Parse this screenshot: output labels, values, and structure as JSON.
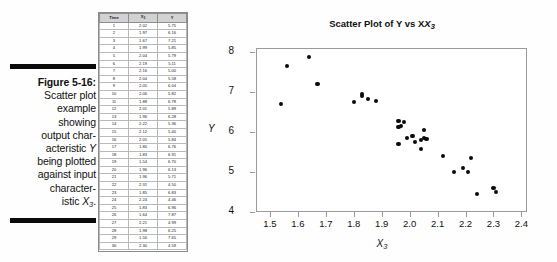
{
  "caption": {
    "figure_label": "Figure 5-16:",
    "lines": [
      "Scatter plot",
      "example",
      "showing",
      "output char-",
      "acteristic Y",
      "being plotted",
      "against input",
      "character-",
      "istic X3."
    ]
  },
  "table": {
    "headers": [
      "Time",
      "X3",
      "Y"
    ],
    "header_base": [
      "Time",
      "X",
      "Y"
    ],
    "header_sub": [
      "",
      "3",
      ""
    ],
    "rows": [
      [
        "1",
        "2.02",
        "5.75"
      ],
      [
        "2",
        "1.97",
        "6.16"
      ],
      [
        "3",
        "1.67",
        "7.21"
      ],
      [
        "4",
        "1.99",
        "5.85"
      ],
      [
        "5",
        "2.04",
        "5.79"
      ],
      [
        "6",
        "2.19",
        "5.11"
      ],
      [
        "7",
        "2.16",
        "5.00"
      ],
      [
        "8",
        "2.04",
        "5.58"
      ],
      [
        "9",
        "2.05",
        "6.04"
      ],
      [
        "10",
        "2.06",
        "5.82"
      ],
      [
        "11",
        "1.88",
        "6.78"
      ],
      [
        "12",
        "2.01",
        "5.89"
      ],
      [
        "13",
        "1.96",
        "6.28"
      ],
      [
        "14",
        "2.22",
        "5.36"
      ],
      [
        "15",
        "2.12",
        "5.40"
      ],
      [
        "16",
        "2.05",
        "5.84"
      ],
      [
        "17",
        "1.80",
        "6.76"
      ],
      [
        "18",
        "1.83",
        "6.91"
      ],
      [
        "19",
        "1.54",
        "6.70"
      ],
      [
        "20",
        "1.96",
        "6.13"
      ],
      [
        "21",
        "1.96",
        "5.71"
      ],
      [
        "22",
        "2.31",
        "4.50"
      ],
      [
        "23",
        "1.85",
        "6.83"
      ],
      [
        "24",
        "2.24",
        "4.46"
      ],
      [
        "25",
        "1.83",
        "6.96"
      ],
      [
        "26",
        "1.64",
        "7.87"
      ],
      [
        "27",
        "2.21",
        "4.99"
      ],
      [
        "28",
        "1.98",
        "6.25"
      ],
      [
        "29",
        "1.56",
        "7.65"
      ],
      [
        "30",
        "2.30",
        "4.59"
      ]
    ]
  },
  "chart_data": {
    "type": "scatter",
    "title_base": "Scatter Plot of Y vs X",
    "title_sub": "3",
    "xlabel": "X3",
    "xlabel_base": "X",
    "xlabel_sub": "3",
    "ylabel": "Y",
    "xlim": [
      1.45,
      2.42
    ],
    "ylim": [
      4.0,
      8.1
    ],
    "xticks": [
      "1.5",
      "1.6",
      "1.7",
      "1.8",
      "1.9",
      "2.0",
      "2.1",
      "2.2",
      "2.3",
      "2.4"
    ],
    "xtick_values": [
      1.5,
      1.6,
      1.7,
      1.8,
      1.9,
      2.0,
      2.1,
      2.2,
      2.3,
      2.4
    ],
    "yticks": [
      "4",
      "5",
      "6",
      "7",
      "8"
    ],
    "ytick_values": [
      4,
      5,
      6,
      7,
      8
    ],
    "grid": false,
    "legend": "none",
    "marker": "filled-circle",
    "marker_color": "#0b0b0b",
    "points": [
      {
        "x": 2.02,
        "y": 5.75
      },
      {
        "x": 1.97,
        "y": 6.16
      },
      {
        "x": 1.67,
        "y": 7.21
      },
      {
        "x": 1.99,
        "y": 5.85
      },
      {
        "x": 2.04,
        "y": 5.79
      },
      {
        "x": 2.19,
        "y": 5.11
      },
      {
        "x": 2.16,
        "y": 5.0
      },
      {
        "x": 2.04,
        "y": 5.58
      },
      {
        "x": 2.05,
        "y": 6.04
      },
      {
        "x": 2.06,
        "y": 5.82
      },
      {
        "x": 1.88,
        "y": 6.78
      },
      {
        "x": 2.01,
        "y": 5.89
      },
      {
        "x": 1.96,
        "y": 6.28
      },
      {
        "x": 2.22,
        "y": 5.36
      },
      {
        "x": 2.12,
        "y": 5.4
      },
      {
        "x": 2.05,
        "y": 5.84
      },
      {
        "x": 1.8,
        "y": 6.76
      },
      {
        "x": 1.83,
        "y": 6.91
      },
      {
        "x": 1.54,
        "y": 6.7
      },
      {
        "x": 1.96,
        "y": 6.13
      },
      {
        "x": 1.96,
        "y": 5.71
      },
      {
        "x": 2.31,
        "y": 4.5
      },
      {
        "x": 1.85,
        "y": 6.83
      },
      {
        "x": 2.24,
        "y": 4.46
      },
      {
        "x": 1.83,
        "y": 6.96
      },
      {
        "x": 1.64,
        "y": 7.87
      },
      {
        "x": 2.21,
        "y": 4.99
      },
      {
        "x": 1.98,
        "y": 6.25
      },
      {
        "x": 1.56,
        "y": 7.65
      },
      {
        "x": 2.3,
        "y": 4.59
      }
    ]
  }
}
